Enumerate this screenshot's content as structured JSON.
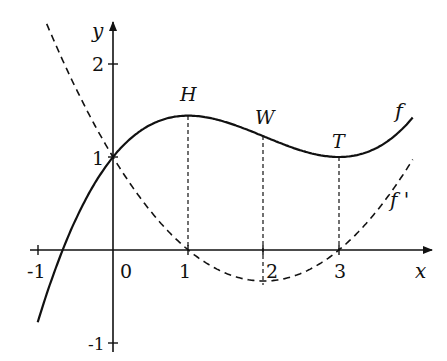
{
  "chart_data": {
    "type": "line",
    "title": "",
    "xlabel": "x",
    "ylabel": "y",
    "xlim": [
      -1,
      4
    ],
    "ylim": [
      -1,
      2.5
    ],
    "grid": false,
    "legend": "inline labels",
    "x_ticks": [
      "-1",
      "0",
      "1",
      "2",
      "3"
    ],
    "y_ticks": [
      "-1",
      "1",
      "2"
    ],
    "series": [
      {
        "name": "f",
        "style": "solid",
        "formula": "f(x) = (1/3)(x^3/3 - 2x^2 + 3x) + 1",
        "x": [
          -1,
          -0.5,
          0,
          0.5,
          1,
          1.5,
          2,
          2.5,
          3,
          3.5,
          4
        ],
        "values": [
          -0.44,
          0.47,
          1.0,
          1.32,
          1.44,
          1.38,
          1.22,
          1.06,
          1.0,
          1.14,
          1.59
        ]
      },
      {
        "name": "f'",
        "style": "dashed",
        "formula": "f'(x) = (1/3)(x-1)(x-3)",
        "x": [
          -0.8,
          -0.5,
          0,
          0.5,
          1,
          1.5,
          2,
          2.5,
          3,
          3.5,
          4
        ],
        "values": [
          2.28,
          1.75,
          1.0,
          0.42,
          0.0,
          -0.25,
          -0.33,
          -0.25,
          0.0,
          0.42,
          1.0
        ]
      }
    ],
    "annotations": [
      {
        "label": "H",
        "x": 1,
        "y": 1.44,
        "meaning": "maximum of f"
      },
      {
        "label": "W",
        "x": 2,
        "y": 1.22,
        "meaning": "inflection point of f"
      },
      {
        "label": "T",
        "x": 3,
        "y": 1.0,
        "meaning": "minimum of f"
      }
    ],
    "dropped_lines_at_x": [
      1,
      2,
      3
    ]
  },
  "labels": {
    "x_axis": "x",
    "y_axis": "y",
    "tick_x_m1": "-1",
    "tick_x_0": "0",
    "tick_x_1": "1",
    "tick_x_2": "2",
    "tick_x_3": "3",
    "tick_y_2": "2",
    "tick_y_1": "1",
    "tick_y_m1": "-1",
    "point_H": "H",
    "point_W": "W",
    "point_T": "T",
    "curve_f": "f",
    "curve_fprime": "f '"
  }
}
